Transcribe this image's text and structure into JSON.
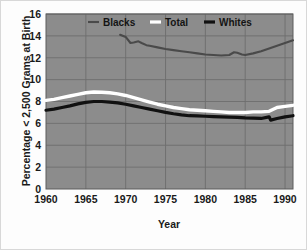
{
  "chart_data": {
    "type": "line",
    "title": "",
    "xlabel": "Year",
    "ylabel": "Percentage < 2,500 Grams at Birth",
    "xlim": [
      1960,
      1991
    ],
    "ylim": [
      0,
      16
    ],
    "grid": true,
    "legend_position": "top-center",
    "xticks": [
      "1960",
      "1965",
      "1970",
      "1975",
      "1980",
      "1985",
      "1990"
    ],
    "xtick_values": [
      1960,
      1965,
      1970,
      1975,
      1980,
      1985,
      1990
    ],
    "yticks": [
      "0",
      "2",
      "4",
      "6",
      "8",
      "10",
      "12",
      "14",
      "16"
    ],
    "ytick_values": [
      0,
      2,
      4,
      6,
      8,
      10,
      12,
      14,
      16
    ],
    "plot_background": "#8c8c8c",
    "figure_background": "#fdfdfd",
    "grid_color": "#6e6e6e",
    "series": [
      {
        "name": "Blacks",
        "color": "#4a4a4a",
        "x": [
          1969.3,
          1970,
          1970.6,
          1971,
          1971.6,
          1972,
          1972.6,
          1973,
          1974,
          1975,
          1976,
          1977,
          1978,
          1979,
          1980,
          1981,
          1982,
          1983,
          1983.6,
          1984,
          1984.6,
          1985,
          1986,
          1987,
          1988,
          1989,
          1990,
          1991
        ],
        "values": [
          14.1,
          13.9,
          13.35,
          13.4,
          13.5,
          13.35,
          13.15,
          13.1,
          12.95,
          12.8,
          12.7,
          12.6,
          12.5,
          12.4,
          12.3,
          12.25,
          12.2,
          12.25,
          12.5,
          12.45,
          12.3,
          12.25,
          12.4,
          12.6,
          12.85,
          13.1,
          13.35,
          13.6
        ]
      },
      {
        "name": "Total",
        "color": "#ffffff",
        "x": [
          1960,
          1961,
          1962,
          1963,
          1964,
          1965,
          1966,
          1967,
          1968,
          1969,
          1970,
          1971,
          1972,
          1973,
          1974,
          1975,
          1976,
          1977,
          1978,
          1979,
          1980,
          1981,
          1982,
          1983,
          1984,
          1985,
          1986,
          1987,
          1988,
          1989,
          1990,
          1991
        ],
        "values": [
          8.1,
          8.2,
          8.35,
          8.5,
          8.65,
          8.8,
          8.87,
          8.85,
          8.8,
          8.7,
          8.55,
          8.35,
          8.15,
          7.95,
          7.75,
          7.6,
          7.45,
          7.35,
          7.25,
          7.2,
          7.15,
          7.1,
          7.05,
          7.0,
          7.0,
          7.0,
          7.05,
          7.05,
          7.1,
          7.45,
          7.55,
          7.65
        ]
      },
      {
        "name": "Whites",
        "color": "#111111",
        "x": [
          1960,
          1961,
          1962,
          1963,
          1964,
          1965,
          1966,
          1967,
          1968,
          1969,
          1970,
          1971,
          1972,
          1973,
          1974,
          1975,
          1976,
          1977,
          1978,
          1979,
          1980,
          1981,
          1982,
          1983,
          1984,
          1985,
          1986,
          1987,
          1988,
          1988.2,
          1989,
          1990,
          1991
        ],
        "values": [
          7.2,
          7.3,
          7.45,
          7.6,
          7.78,
          7.92,
          8.0,
          8.0,
          7.95,
          7.87,
          7.75,
          7.6,
          7.45,
          7.3,
          7.15,
          7.0,
          6.88,
          6.78,
          6.7,
          6.68,
          6.65,
          6.62,
          6.6,
          6.58,
          6.55,
          6.5,
          6.48,
          6.45,
          6.6,
          6.3,
          6.45,
          6.6,
          6.7
        ]
      }
    ]
  },
  "legend": {
    "items": [
      {
        "label": "Blacks",
        "color": "#4a4a4a"
      },
      {
        "label": "Total",
        "color": "#ffffff"
      },
      {
        "label": "Whites",
        "color": "#111111"
      }
    ]
  },
  "axes": {
    "x_title": "Year",
    "y_title": "Percentage < 2,500 Grams at Birth"
  }
}
